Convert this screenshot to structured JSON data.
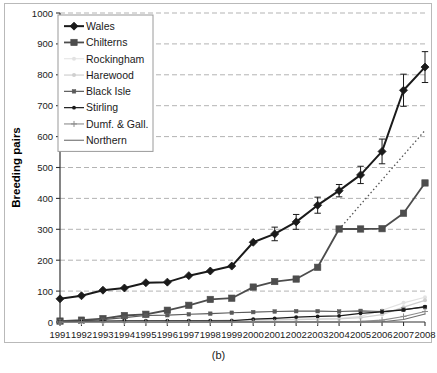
{
  "figure": {
    "caption": "(b)"
  },
  "chart_data": {
    "type": "line",
    "title": "",
    "subtitle": "",
    "xlabel": "",
    "ylabel": "Breeding pairs",
    "xlim": [
      1991,
      2008
    ],
    "ylim": [
      0,
      1000
    ],
    "y_ticks": [
      0,
      100,
      200,
      300,
      400,
      500,
      600,
      700,
      800,
      900,
      1000
    ],
    "y_tick_labels": [
      "0",
      "100",
      "200",
      "300",
      "400",
      "500",
      "600",
      "700",
      "800",
      "900",
      "1000"
    ],
    "grid": "horizontal-dashed",
    "legend_position": "upper-left-inside",
    "x": [
      1991,
      1992,
      1993,
      1994,
      1995,
      1996,
      1997,
      1998,
      1999,
      2000,
      2001,
      2002,
      2003,
      2004,
      2005,
      2006,
      2007,
      2008
    ],
    "x_tick_labels": [
      "1991",
      "1992",
      "1993",
      "1994",
      "1995",
      "1996",
      "1997",
      "1998",
      "1999",
      "2000",
      "2001",
      "2002",
      "2003",
      "2004",
      "2005",
      "2006",
      "2007",
      "2008"
    ],
    "series": [
      {
        "name": "Wales",
        "color": "#1a1a1a",
        "marker": "diamond",
        "line_width": 2,
        "values": [
          75,
          85,
          103,
          110,
          127,
          129,
          150,
          165,
          181,
          258,
          285,
          324,
          378,
          425,
          476,
          552,
          750,
          825
        ],
        "errors": [
          null,
          null,
          null,
          null,
          null,
          null,
          null,
          null,
          null,
          null,
          22,
          24,
          26,
          20,
          28,
          40,
          52,
          50
        ]
      },
      {
        "name": "Chilterns",
        "color": "#4d4d4d",
        "marker": "square",
        "line_width": 1.8,
        "values": [
          3,
          6,
          11,
          21,
          25,
          38,
          54,
          73,
          77,
          113,
          131,
          139,
          177,
          301,
          301,
          302,
          352,
          450
        ],
        "errors": [
          null,
          null,
          null,
          null,
          null,
          null,
          null,
          null,
          null,
          null,
          null,
          null,
          null,
          null,
          null,
          null,
          null,
          null
        ]
      },
      {
        "name": "Rockingham",
        "color": "#e2e2e2",
        "marker": "dot",
        "line_width": 1.2,
        "values": [
          0,
          0,
          0,
          1,
          2,
          3,
          4,
          5,
          6,
          7,
          8,
          9,
          10,
          12,
          18,
          38,
          62,
          80
        ],
        "errors": [
          null,
          null,
          null,
          null,
          null,
          null,
          null,
          null,
          null,
          null,
          null,
          null,
          null,
          null,
          null,
          null,
          null,
          null
        ]
      },
      {
        "name": "Harewood",
        "color": "#cfcfcf",
        "marker": "dot",
        "line_width": 1.2,
        "values": [
          0,
          0,
          0,
          0,
          1,
          2,
          3,
          4,
          5,
          6,
          7,
          8,
          9,
          10,
          14,
          24,
          48,
          70
        ],
        "errors": [
          null,
          null,
          null,
          null,
          null,
          null,
          null,
          null,
          null,
          null,
          null,
          null,
          null,
          null,
          null,
          null,
          null,
          null
        ]
      },
      {
        "name": "Black Isle",
        "color": "#5a5a5a",
        "marker": "small-square",
        "line_width": 1.2,
        "values": [
          2,
          4,
          8,
          14,
          21,
          22,
          25,
          27,
          30,
          32,
          34,
          35,
          35,
          34,
          36,
          34,
          40,
          48
        ],
        "errors": [
          null,
          null,
          null,
          null,
          null,
          null,
          null,
          null,
          null,
          null,
          null,
          null,
          null,
          null,
          null,
          null,
          null,
          null
        ]
      },
      {
        "name": "Stirling",
        "color": "#1a1a1a",
        "marker": "small-dot",
        "line_width": 1.2,
        "values": [
          1,
          2,
          3,
          4,
          4,
          4,
          4,
          4,
          4,
          9,
          12,
          16,
          18,
          20,
          28,
          33,
          39,
          50
        ],
        "errors": [
          null,
          null,
          null,
          null,
          null,
          null,
          null,
          null,
          null,
          null,
          null,
          null,
          null,
          null,
          null,
          null,
          null,
          null
        ]
      },
      {
        "name": "Dumf. & Gall.",
        "color": "#8c8c8c",
        "marker": "plus",
        "line_width": 1.1,
        "values": [
          0,
          0,
          0,
          0,
          0,
          0,
          0,
          0,
          0,
          0,
          0,
          0,
          0,
          0,
          2,
          6,
          18,
          34
        ]
      },
      {
        "name": "Northern",
        "color": "#6e6e6e",
        "marker": "line",
        "line_width": 1.1,
        "values": [
          0,
          0,
          0,
          0,
          0,
          0,
          0,
          0,
          0,
          0,
          0,
          0,
          0,
          0,
          0,
          1,
          8,
          26
        ]
      }
    ],
    "annotations": [
      {
        "name": "projection-trend",
        "style": "dotted",
        "color": "#555555",
        "from": {
          "x": 2004,
          "y": 300
        },
        "to": {
          "x": 2008,
          "y": 620
        }
      }
    ]
  }
}
